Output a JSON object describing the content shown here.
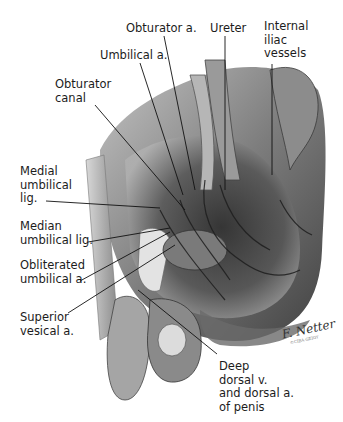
{
  "figure": {
    "labels": [
      {
        "id": "obturator-a",
        "text": "Obturator a.",
        "x": 126,
        "y": 22
      },
      {
        "id": "ureter",
        "text": "Ureter",
        "x": 210,
        "y": 22
      },
      {
        "id": "internal-iliac-vessels",
        "text": "Internal\niliac\nvessels",
        "x": 264,
        "y": 20
      },
      {
        "id": "umbilical-a",
        "text": "Umbilical a.",
        "x": 100,
        "y": 49
      },
      {
        "id": "obturator-canal",
        "text": "Obturator\ncanal",
        "x": 55,
        "y": 78
      },
      {
        "id": "medial-umbilical-lig",
        "text": "Medial\numbilical\nlig.",
        "x": 20,
        "y": 165
      },
      {
        "id": "median-umbilical-lig",
        "text": "Median\numbilical lig.",
        "x": 20,
        "y": 220
      },
      {
        "id": "obliterated-umbilical-a",
        "text": "Obliterated\numbilical a.",
        "x": 20,
        "y": 259
      },
      {
        "id": "superior-vesical-a",
        "text": "Superior\nvesical a.",
        "x": 20,
        "y": 311
      },
      {
        "id": "deep-dorsal-v",
        "text": "Deep\ndorsal v.\nand dorsal a.\nof penis",
        "x": 219,
        "y": 360
      }
    ],
    "signature": {
      "text": "F. Netter",
      "subtext": "©CIBA-GEIGY"
    }
  }
}
